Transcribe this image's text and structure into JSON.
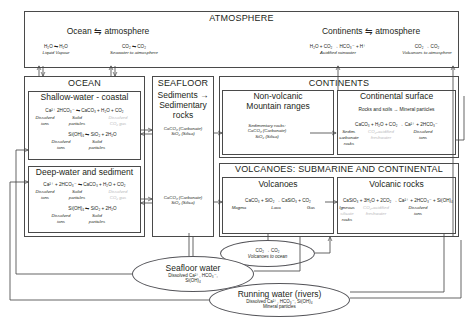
{
  "diagram": {
    "atmosphere": {
      "title": "ATMOSPHERE",
      "left_group": {
        "heading": "Ocean ⇋ atmosphere",
        "reactions": [
          {
            "equation": "H₂O ⇋ H₂O",
            "caption": "Liquid  Vapour"
          },
          {
            "equation": "CO₂ ⇋ CO₂",
            "caption": "Seawater to atmosphere"
          }
        ]
      },
      "right_group": {
        "heading": "Continents ⇋ atmosphere",
        "reactions": [
          {
            "equation": "H₂O + CO₂ → HCO₃⁻ + H⁺",
            "caption": "Acidified rainwater"
          },
          {
            "equation": "CO₂ → CO₂",
            "caption": "Volcanoes to atmosphere"
          }
        ]
      }
    },
    "ocean": {
      "title": "OCEAN",
      "shallow": {
        "title": "Shallow-water - coastal",
        "eq1": {
          "equation": "Ca²⁺ 2HCO₃⁻  ⇋  CaCO₃ + H₂O + CO₂",
          "label_a": "Dissolved",
          "label_b": "Solid",
          "label_c": "Dissolved",
          "label_a2": "ions",
          "label_b2": "particles",
          "label_c2": "CO₂ gas"
        },
        "eq2": {
          "equation": "Si(OH)₄  ⇋  SiO₂ + 2H₂O",
          "label_a": "Dissolved",
          "label_b": "Solid",
          "label_a2": "ions",
          "label_b2": "particles"
        }
      },
      "deep": {
        "title": "Deep-water and sediment",
        "eq1": {
          "equation": "Ca²⁺ + 2HCO₃⁻  ⇋  CaCO₃ + H₂O + CO₂",
          "label_a": "Dissolved",
          "label_b": "Solid",
          "label_c": "Dissolved",
          "label_a2": "ions",
          "label_b2": "particles",
          "label_c2": "CO₂ gas"
        },
        "eq2": {
          "equation": "Si(OH)₄  ⇋  SiO₂ + 2H₂O",
          "label_a": "Dissolved",
          "label_b": "Solid",
          "label_a2": "ions",
          "label_b2": "particles"
        }
      }
    },
    "seafloor": {
      "title": "SEAFLOOR",
      "subtitle_line1": "Sediments →",
      "subtitle_line2": "Sedimentary",
      "subtitle_line3": "rocks",
      "upper": {
        "line1": "CaCO₃ (Carbonate)",
        "line2": "SiO₂ (Silica)"
      },
      "lower": {
        "line1": "CaCO₃ (Carbonate)",
        "line2": "SiO₂ (Silica)"
      }
    },
    "continents": {
      "title": "CONTINENTS",
      "mountains": {
        "title_line1": "Non-volcanic",
        "title_line2": "Mountain ranges",
        "line1": "Sedimentary rocks:",
        "line2": "CaCO₃ (Carbonate)",
        "line3": "SiO₂ (Silica)"
      },
      "surface": {
        "title": "Continental surface",
        "subtitle": "Rocks and soils → Mineral particles",
        "equation": "CaCO₃ + H₂O + CO₂  → Ca²⁺ + 2HCO₃⁻",
        "label_a": "Sedim.",
        "label_a2": "carbonate",
        "label_a3": "rocks",
        "label_b": "CO₂-acidified",
        "label_b2": "freshwater",
        "label_c": "Dissolved",
        "label_c2": "ions"
      }
    },
    "volcanoes": {
      "title": "VOLCANOES: SUBMARINE AND CONTINENTAL",
      "left": {
        "title": "Volcanoes",
        "equation": "CaCO₃ + SiO₂ → CaSiO₃ + CO₂",
        "label_a": "Magma",
        "label_b": "Lava",
        "label_c": "Gas"
      },
      "right": {
        "title": "Volcanic rocks",
        "equation": "CaSiO₃ + 3H₂O + 2CO₂  → Ca²⁺ + 2HCO₃⁻ + Si(OH)₄",
        "label_a": "Igneous",
        "label_a2": "silicate",
        "label_a3": "rocks",
        "label_b": "CO₂-acidified",
        "label_b2": "freshwater",
        "label_c": "Dissolved",
        "label_c2": "ions"
      }
    },
    "ellipses": {
      "volcanoes_to_ocean": {
        "line1": "CO₂ → CO₂",
        "line2": "Volcanoes to ocean"
      },
      "seafloor_water": {
        "title": "Seafloor water",
        "line1": "Dissolved Ca²⁺, HCO₃⁻,",
        "line2": "Si(OH)₄"
      },
      "running_water": {
        "title": "Running water (rivers)",
        "line1": "Dissolved Ca²⁺, HCO₃⁻,  Si(OH)₄",
        "line2": "Mineral particles"
      }
    },
    "colors": {
      "line": "#4a4a4a",
      "text": "#231f20",
      "dim_text": "#b9b9bb",
      "background": "#ffffff"
    }
  }
}
